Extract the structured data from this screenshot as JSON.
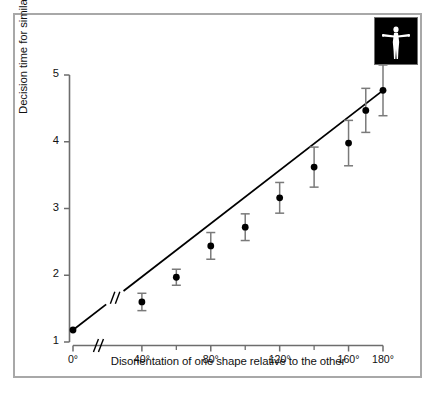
{
  "figure": {
    "background_color": "#ffffff",
    "frame_color": "#a8a8a8",
    "ink_color": "#000000",
    "errorbar_color": "#7a7a7a"
  },
  "inset": {
    "name": "human-figure-inset",
    "background_color": "#000000",
    "figure_color": "#ffffff",
    "description": "white human figure with outstretched arms on black square"
  },
  "chart_data": {
    "type": "scatter",
    "title": "",
    "subtitle": "",
    "xlabel": "Disorientation of one shape relative to the other",
    "ylabel": "Decision time for similar pairs (sec)",
    "x": [
      0,
      40,
      60,
      80,
      100,
      120,
      140,
      160,
      170,
      180
    ],
    "y": [
      1.18,
      1.6,
      1.97,
      2.44,
      2.72,
      3.16,
      3.62,
      3.98,
      4.47,
      4.77
    ],
    "yerr": [
      0.0,
      0.13,
      0.12,
      0.2,
      0.2,
      0.23,
      0.3,
      0.34,
      0.33,
      0.38
    ],
    "xtick_labels": [
      "0°",
      "40°",
      "80°",
      "120°",
      "160°",
      "180°"
    ],
    "xtick_values": [
      0,
      40,
      80,
      120,
      160,
      180
    ],
    "xminor_values": [
      60,
      100,
      140
    ],
    "ytick_labels": [
      "1",
      "2",
      "3",
      "4",
      "5"
    ],
    "ytick_values": [
      1,
      2,
      3,
      4,
      5
    ],
    "xlim": [
      0,
      180
    ],
    "ylim": [
      1,
      5
    ],
    "grid": false,
    "legend": null,
    "axis_break": {
      "axis": "x",
      "marker": "//",
      "between": [
        0,
        40
      ],
      "note": "double slash break on x axis and on fitted line"
    },
    "fit_line": {
      "type": "line",
      "from": {
        "x": 0,
        "y": 1.18
      },
      "to": {
        "x": 180,
        "y": 4.77
      }
    }
  }
}
